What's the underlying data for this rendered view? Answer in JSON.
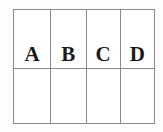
{
  "figure": {
    "type": "table-grid",
    "border_color": "#8b8b8b",
    "text_color": "#1a1a1a",
    "background_color": "#ffffff"
  },
  "table": {
    "columns": 4,
    "rows": 2,
    "rows_data": [
      {
        "cells": [
          {
            "label": "A"
          },
          {
            "label": "B"
          },
          {
            "label": "C"
          },
          {
            "label": "D"
          }
        ]
      },
      {
        "cells": [
          {
            "label": ""
          },
          {
            "label": ""
          },
          {
            "label": ""
          },
          {
            "label": ""
          }
        ]
      }
    ]
  }
}
